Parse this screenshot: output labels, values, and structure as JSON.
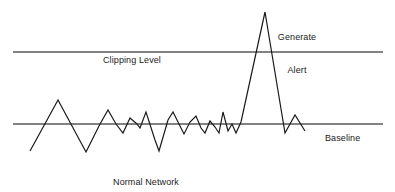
{
  "figure": {
    "background_color": "#ffffff"
  },
  "labels": {
    "clipping_level": "Clipping Level",
    "generate_alert_line1": "Generate",
    "generate_alert_line2": "Alert",
    "baseline": "Baseline",
    "normal_activity_line1": "Normal Network",
    "normal_activity_line2": "Activity"
  },
  "colors": {
    "reference_line": "#595959",
    "signal_line": "#1a1a1a",
    "text": "#1a1a1a",
    "background": "#ffffff"
  },
  "chart_data": {
    "type": "line",
    "xlabel": "",
    "ylabel": "",
    "xlim": [
      0,
      395
    ],
    "ylim": [
      192,
      0
    ],
    "grid": false,
    "legend": "none",
    "reference_lines": [
      {
        "name": "Clipping Level",
        "y": 52,
        "x_start": 13,
        "x_end": 383,
        "color": "#595959",
        "width": 1.3
      },
      {
        "name": "Baseline",
        "y": 124,
        "x_start": 13,
        "x_end": 383,
        "color": "#595959",
        "width": 1.3
      }
    ],
    "series": [
      {
        "name": "Normal Network Activity",
        "color": "#1a1a1a",
        "width": 1.2,
        "points": [
          [
            30,
            151
          ],
          [
            58,
            100
          ],
          [
            86,
            152
          ],
          [
            100,
            124
          ],
          [
            108,
            110
          ],
          [
            116,
            124
          ],
          [
            123,
            133
          ],
          [
            130,
            118
          ],
          [
            137,
            124
          ],
          [
            140,
            128
          ],
          [
            146,
            112
          ],
          [
            155,
            140
          ],
          [
            159,
            151
          ],
          [
            168,
            120
          ],
          [
            173,
            112
          ],
          [
            179,
            124
          ],
          [
            184,
            134
          ],
          [
            190,
            122
          ],
          [
            196,
            116
          ],
          [
            201,
            128
          ],
          [
            205,
            133
          ],
          [
            210,
            121
          ],
          [
            215,
            127
          ],
          [
            219,
            133
          ],
          [
            223,
            112
          ],
          [
            228,
            131
          ],
          [
            232,
            124
          ],
          [
            236,
            133
          ],
          [
            241,
            122
          ],
          [
            265,
            12
          ],
          [
            285,
            133
          ],
          [
            295,
            115
          ],
          [
            305,
            131
          ]
        ]
      }
    ],
    "annotations": [
      {
        "name": "clipping-level-label",
        "text": "Clipping Level",
        "x": 147,
        "y": 38
      },
      {
        "name": "generate-alert-label",
        "text": "Generate Alert",
        "x": 297,
        "y": 21
      },
      {
        "name": "baseline-label",
        "text": "Baseline",
        "x": 325,
        "y": 116
      },
      {
        "name": "normal-network-activity-label",
        "text": "Normal Network Activity",
        "x": 146,
        "y": 166
      }
    ]
  }
}
